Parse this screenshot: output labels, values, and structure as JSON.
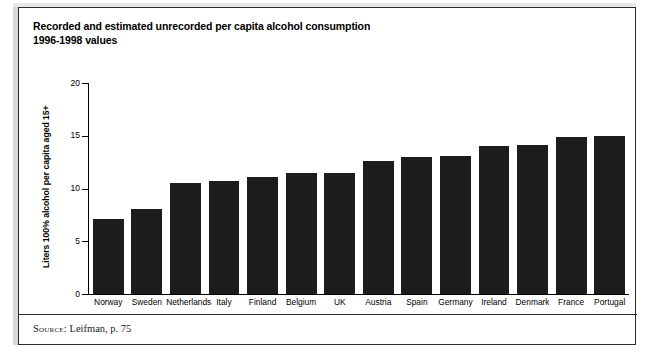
{
  "figure": {
    "title_line1": "Recorded and estimated unrecorded per capita alcohol consumption",
    "title_line2": "1996-1998 values",
    "source_label": "Source:",
    "source_text": "Leifman, p. 75",
    "bar_color": "#1c1c1c",
    "frame_color": "#2b2b2b",
    "background_color": "#ffffff"
  },
  "chart_data": {
    "type": "bar",
    "title": "Recorded and estimated unrecorded per capita alcohol consumption 1996-1998 values",
    "xlabel": "",
    "ylabel": "Liters 100% alcohol per capita aged 15+",
    "ylim": [
      0,
      20
    ],
    "yticks": [
      0,
      5,
      10,
      15,
      20
    ],
    "ytick_labels": [
      "0",
      "5",
      "10",
      "15",
      "20"
    ],
    "grid": false,
    "legend": false,
    "categories": [
      "Norway",
      "Sweden",
      "Netherlands",
      "Italy",
      "Finland",
      "Belgium",
      "UK",
      "Austria",
      "Spain",
      "Germany",
      "Ireland",
      "Denmark",
      "France",
      "Portugal"
    ],
    "values": [
      7.1,
      8.1,
      10.5,
      10.7,
      11.1,
      11.5,
      11.5,
      12.6,
      13.0,
      13.1,
      14.0,
      14.1,
      14.9,
      15.0
    ]
  }
}
